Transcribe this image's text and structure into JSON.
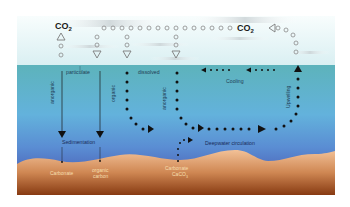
{
  "colors": {
    "sky_top": "#ffffff",
    "sky_bottom": "#dff1f4",
    "sea_surface": "#5fb3bd",
    "sea_mid": "#62a9da",
    "sea_deep": "#4f6fc0",
    "sediment_top": "#efb98a",
    "sediment_bottom": "#8a3d13",
    "arrow": "#111111",
    "co2_symbol": "#888888",
    "sediment_text": "#f6dfb0"
  },
  "atmosphere": {
    "co2_left": {
      "label": "CO",
      "sub": "2"
    },
    "co2_right": {
      "label": "CO",
      "sub": "2"
    }
  },
  "water": {
    "particulate_label": "particulate",
    "dissolved_label": "dissolved",
    "anorganic_left_label": "anorganic",
    "organic_left_label": "organic",
    "organic_dissolved_label": "organic",
    "anorganic_dissolved_label": "anorganic",
    "cooling_label": "Cooling",
    "upwelling_label": "Upwelling",
    "sedimentation_label": "Sedimentation",
    "deepwater_label": "Deepwater circulation"
  },
  "sediment": {
    "carbonate_left_label": "Carbonate",
    "organic_carbon_line1": "organic",
    "organic_carbon_line2": "carbon",
    "carbonate_right_line1": "Carbonate",
    "carbonate_right_line2": "CaCO",
    "carbonate_right_sub": "3"
  }
}
